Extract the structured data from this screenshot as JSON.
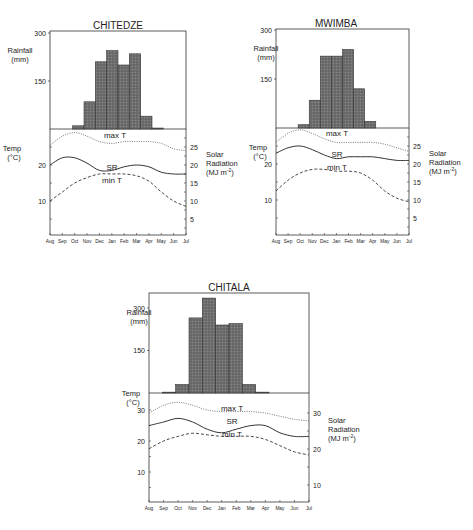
{
  "chart_data": [
    {
      "type": "bar+line",
      "title": "CHITEDZE",
      "months": [
        "Aug",
        "Sep",
        "Oct",
        "Nov",
        "Dec",
        "Jan",
        "Feb",
        "Mar",
        "Apr",
        "May",
        "Jun",
        "Jul"
      ],
      "rainfall": {
        "ylabel": "Rainfall (mm)",
        "yticks": [
          150,
          300
        ],
        "ylim": [
          0,
          300
        ],
        "values": [
          0,
          0,
          10,
          85,
          210,
          245,
          200,
          235,
          40,
          3,
          0,
          0
        ]
      },
      "temperature": {
        "ylabel": "Temp (°C)",
        "yticks": [
          10,
          20
        ],
        "ylim": [
          0,
          30
        ],
        "max_T": [
          25.5,
          28,
          29,
          28,
          26.5,
          26,
          26.5,
          26.5,
          26.5,
          26,
          24.5,
          24
        ],
        "min_T": [
          10,
          12.5,
          15,
          16.5,
          17.5,
          17.5,
          17.5,
          17,
          15.5,
          12.5,
          10,
          8.5
        ]
      },
      "solar_radiation": {
        "ylabel": "Solar Radiation (MJ m-2)",
        "yticks": [
          5,
          10,
          15,
          20,
          25
        ],
        "ylim": [
          0,
          30
        ],
        "values": [
          20,
          22,
          22,
          20.5,
          18.5,
          18.5,
          19.5,
          20,
          19.5,
          18,
          17.5,
          17.5
        ]
      },
      "curve_labels": {
        "max": "max  T",
        "sr": "SR",
        "min": "min  T"
      }
    },
    {
      "type": "bar+line",
      "title": "MWIMBA",
      "months": [
        "Aug",
        "Sep",
        "Oct",
        "Nov",
        "Dec",
        "Jan",
        "Feb",
        "Mar",
        "Apr",
        "May",
        "Jun",
        "Jul"
      ],
      "rainfall": {
        "ylabel": "Rainfall (mm)",
        "yticks": [
          150,
          300
        ],
        "ylim": [
          0,
          300
        ],
        "values": [
          0,
          0,
          10,
          85,
          220,
          220,
          240,
          120,
          20,
          0,
          0,
          0
        ]
      },
      "temperature": {
        "ylabel": "Temp (°C)",
        "yticks": [
          10,
          20
        ],
        "ylim": [
          0,
          30
        ],
        "max_T": [
          26,
          28.5,
          29.5,
          28.5,
          27,
          26,
          26,
          26,
          26,
          25.5,
          24.5,
          23.5
        ],
        "min_T": [
          12.5,
          15.5,
          17.5,
          18.5,
          18.5,
          18,
          18,
          17.5,
          15.5,
          12.5,
          10.5,
          9.5
        ]
      },
      "solar_radiation": {
        "ylabel": "Solar Radiation (MJ m-2)",
        "yticks": [
          5,
          10,
          15,
          20,
          25
        ],
        "ylim": [
          0,
          30
        ],
        "values": [
          23,
          24.5,
          25,
          24,
          22.5,
          21.5,
          22,
          22,
          22,
          21.5,
          21,
          21
        ]
      },
      "curve_labels": {
        "max": "max  T",
        "sr": "SR",
        "min": "min  T"
      }
    },
    {
      "type": "bar+line",
      "title": "CHITALA",
      "months": [
        "Aug",
        "Sep",
        "Oct",
        "Nov",
        "Dec",
        "Jan",
        "Feb",
        "Mar",
        "Apr",
        "May",
        "Jun",
        "Jul"
      ],
      "rainfall": {
        "ylabel": "Rainfall (mm)",
        "yticks": [
          150,
          300
        ],
        "ylim": [
          0,
          340
        ],
        "values": [
          0,
          3,
          30,
          265,
          335,
          240,
          245,
          30,
          3,
          0,
          0,
          0
        ]
      },
      "temperature": {
        "ylabel": "Temp (°C)",
        "yticks": [
          10,
          20,
          30
        ],
        "ylim": [
          0,
          35
        ],
        "max_T": [
          29,
          31.5,
          32.5,
          31.5,
          30,
          29.5,
          29.5,
          29.5,
          29,
          28,
          27,
          26.5
        ],
        "min_T": [
          17.5,
          20,
          21.5,
          22.5,
          22,
          21.5,
          21.5,
          21.5,
          20.5,
          18.5,
          16.5,
          15.5
        ]
      },
      "solar_radiation": {
        "ylabel": "Solar Radiation (MJ m-2)",
        "yticks": [
          10,
          20,
          30
        ],
        "ylim": [
          5,
          34
        ],
        "values": [
          26.5,
          27.5,
          28.5,
          27.5,
          25.5,
          24.5,
          25.5,
          26.5,
          26.5,
          24.5,
          23.5,
          23.5
        ]
      },
      "curve_labels": {
        "max": "max  T",
        "sr": "SR",
        "min": "min  T"
      }
    }
  ],
  "labels": {
    "rainfall_line1": "Rainfall",
    "rainfall_line2": "(mm)",
    "temp_line1": "Temp",
    "temp_line2": "(°C)",
    "solar_line1": "Solar",
    "solar_line2": "Radiation",
    "solar_line3": "(MJ  m",
    "solar_sup": "-2",
    "solar_close": ")"
  },
  "colors": {
    "bar_fill": "#6e6e6e",
    "bar_stroke": "#333333",
    "axis": "#333333",
    "curve": "#333333"
  }
}
